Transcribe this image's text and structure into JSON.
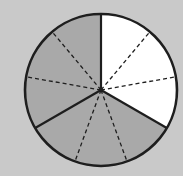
{
  "diagram": {
    "type": "fraction-circle",
    "center": [
      101,
      90
    ],
    "radius": 76,
    "total_parts": 9,
    "major_sectors": 3,
    "subdivisions_per_sector": 3,
    "shaded_parts": 6,
    "unshaded_parts": 3,
    "fraction_shaded": "6/9",
    "fraction_unshaded": "3/9",
    "sectors": [
      {
        "start_deg": 0,
        "end_deg": 120,
        "fill": "unshaded"
      },
      {
        "start_deg": 120,
        "end_deg": 240,
        "fill": "shaded"
      },
      {
        "start_deg": 240,
        "end_deg": 360,
        "fill": "shaded"
      }
    ],
    "solid_line_angles": [
      0,
      120,
      240
    ],
    "dashed_line_angles": [
      40,
      80,
      160,
      200,
      280,
      320
    ]
  },
  "colors": {
    "background": "#c9c9c9",
    "shaded": "#a9a9a9",
    "unshaded": "#ffffff",
    "line": "#1e1e1e"
  }
}
